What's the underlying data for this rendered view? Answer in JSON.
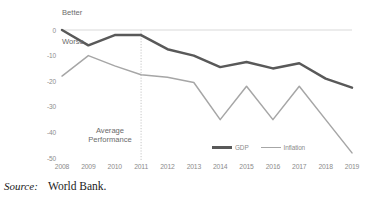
{
  "figure": {
    "source_label": "Source:",
    "source_value": "World Bank."
  },
  "chart_data": {
    "type": "line",
    "title": "",
    "xlabel": "",
    "ylabel": "",
    "categories": [
      "2008",
      "2009",
      "2010",
      "2011",
      "2012",
      "2013",
      "2014",
      "2015",
      "2016",
      "2017",
      "2018",
      "2019"
    ],
    "x": [
      2008,
      2009,
      2010,
      2011,
      2012,
      2013,
      2014,
      2015,
      2016,
      2017,
      2018,
      2019
    ],
    "series": [
      {
        "name": "GDP",
        "color": "#595959",
        "width": 2.5,
        "values": [
          0,
          -6,
          -2,
          -2,
          -7.5,
          -10,
          -14.5,
          -12.5,
          -15,
          -13,
          -19,
          -22.5
        ]
      },
      {
        "name": "Inflation",
        "color": "#a6a6a6",
        "width": 1.5,
        "values": [
          -18,
          -10,
          -14,
          -17.5,
          -18.5,
          -20.5,
          -35,
          -22,
          -35,
          -22,
          -35,
          -48
        ]
      }
    ],
    "ylim": [
      -50,
      0
    ],
    "xlim": [
      2008,
      2019
    ],
    "yticks": [
      0,
      -10,
      -20,
      -30,
      -40,
      -50
    ],
    "ytick_labels": [
      "0",
      "-10",
      "-20",
      "-30",
      "-40",
      "-50"
    ],
    "xtick_labels": [
      "2008",
      "2009",
      "2010",
      "2011",
      "2012",
      "2013",
      "2014",
      "2015",
      "2016",
      "2017",
      "2018",
      "2019"
    ],
    "grid": false,
    "zero_line": true,
    "zero_line_color": "#d9d9d9",
    "legend_position": "inside-bottom-right",
    "legend_entries": [
      "GDP",
      "Inflation"
    ],
    "annotations": [
      {
        "name": "better",
        "text": "Better",
        "x": 2008,
        "y": 4
      },
      {
        "name": "worse",
        "text": "Worse",
        "x": 2008,
        "y": -7
      },
      {
        "name": "average-performance",
        "text": "Average Performance",
        "x": 2009.6,
        "y": -40
      }
    ],
    "reference_lines": [
      {
        "name": "average-performance-divider",
        "x": 2011,
        "style": "dotted",
        "color": "#bfbfbf"
      }
    ]
  }
}
